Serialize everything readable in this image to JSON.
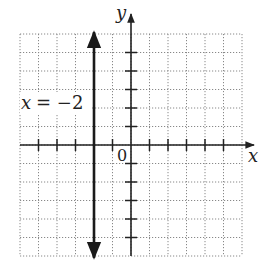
{
  "chart_data": {
    "type": "line",
    "title": "",
    "xlabel": "x",
    "ylabel": "y",
    "xlim": [
      -6,
      6
    ],
    "ylim": [
      -6,
      6
    ],
    "grid": true,
    "origin_label": "0",
    "series": [
      {
        "name": "x = -2",
        "equation": "x = -2",
        "kind": "vertical-line",
        "x": [
          -2,
          -2
        ],
        "y": [
          -6,
          6
        ]
      }
    ],
    "annotations": [
      {
        "text": "x = −2",
        "x": -5.8,
        "y": 1.1
      }
    ]
  },
  "labels": {
    "x_axis": "x",
    "y_axis": "y",
    "origin": "0",
    "line_label_x": "x",
    "line_label_eq": "= −2"
  },
  "colors": {
    "axis": "#222222",
    "grid": "#888888",
    "line": "#1a1a1a"
  }
}
